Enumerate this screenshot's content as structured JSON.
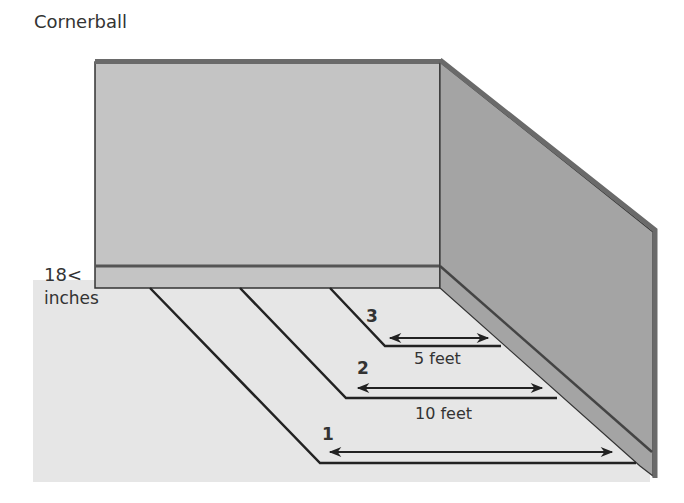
{
  "title": "Cornerball",
  "wall_height_label": {
    "value": "18",
    "symbol": "<",
    "unit": "inches"
  },
  "zones": [
    {
      "number": "3",
      "distance": "5 feet"
    },
    {
      "number": "2",
      "distance": "10 feet"
    },
    {
      "number": "1",
      "distance": ""
    }
  ],
  "colors": {
    "back_wall": "#c4c4c4",
    "side_wall": "#a4a4a4",
    "wall_edge": "#6a6a6a",
    "floor": "#e6e6e6",
    "line": "#222222",
    "text": "#333333"
  }
}
